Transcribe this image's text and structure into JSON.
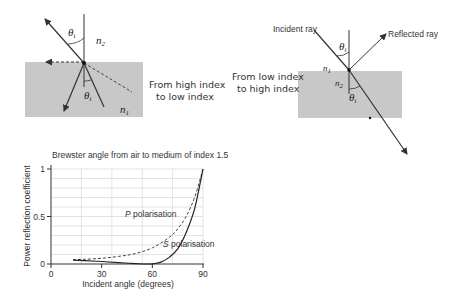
{
  "diagram_left": {
    "caption_line1": "From high index",
    "caption_line2": "to low index",
    "theta_t_label": "θ",
    "theta_t_sub": "t",
    "theta_i_label": "θ",
    "theta_i_sub": "i",
    "n2_label": "n",
    "n2_sub": "2",
    "n1_label": "n",
    "n1_sub": "1",
    "medium_color": "#c8c8c8"
  },
  "diagram_right": {
    "caption_line1": "From low index",
    "caption_line2": "to high index",
    "incident_label": "Incident ray",
    "reflected_label": "Reflected ray",
    "theta_i_label": "θ",
    "theta_i_sub": "i",
    "theta_t_label": "θ",
    "theta_t_sub": "t",
    "n1_label": "n",
    "n1_sub": "1",
    "n2_label": "n",
    "n2_sub": "2",
    "medium_color": "#c8c8c8"
  },
  "chart_data": {
    "type": "line",
    "title": "Brewster angle from air to medium of index 1.5",
    "xlabel": "Incident angle (degrees)",
    "ylabel": "Power reflection coefficient",
    "xlim": [
      0,
      90
    ],
    "ylim": [
      0,
      1
    ],
    "x_ticks": [
      "0",
      "30",
      "60",
      "90"
    ],
    "y_ticks": [
      "0",
      "0.5",
      "1"
    ],
    "grid": true,
    "series": [
      {
        "name": "P polarisation",
        "style": "dashed",
        "x": [
          13,
          20,
          30,
          40,
          50,
          60,
          70,
          75,
          80,
          85,
          90
        ],
        "values": [
          0.045,
          0.05,
          0.06,
          0.08,
          0.11,
          0.17,
          0.28,
          0.37,
          0.5,
          0.7,
          1.0
        ]
      },
      {
        "name": "S polarisation",
        "style": "solid",
        "x": [
          13,
          20,
          30,
          40,
          50,
          56,
          60,
          65,
          70,
          75,
          80,
          85,
          90
        ],
        "values": [
          0.04,
          0.035,
          0.026,
          0.014,
          0.004,
          0.0,
          0.002,
          0.02,
          0.07,
          0.16,
          0.33,
          0.58,
          1.0
        ]
      }
    ],
    "annotations": [
      {
        "text": "P polarisation",
        "x": 62,
        "y": 0.28
      },
      {
        "text": "S polarisation",
        "x": 78,
        "y": 0.12
      }
    ]
  }
}
